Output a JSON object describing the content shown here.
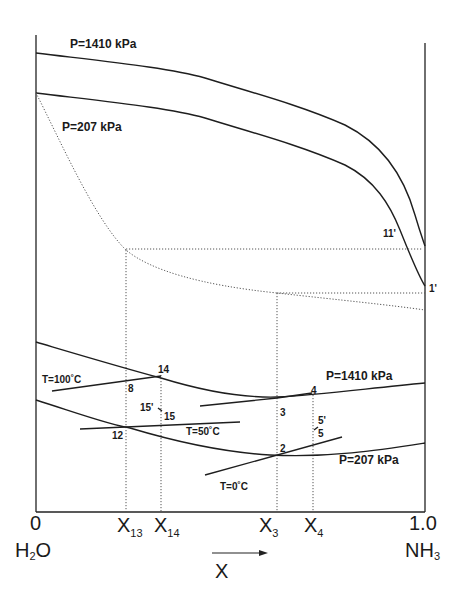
{
  "diagram": {
    "type": "enthalpy-concentration diagram (ammonia-water)",
    "axis": {
      "x_left_tick": "0",
      "x_right_tick": "1.0",
      "x_left_species": "H",
      "x_left_species_sub": "2",
      "x_left_species_tail": "O",
      "x_right_species": "NH",
      "x_right_species_sub": "3",
      "x_label": "X",
      "composition_ticks": [
        {
          "base": "X",
          "sub": "13"
        },
        {
          "base": "X",
          "sub": "14"
        },
        {
          "base": "X",
          "sub": "3"
        },
        {
          "base": "X",
          "sub": "4"
        }
      ]
    },
    "curve_labels": {
      "vapor_high_pressure": "P=1410 kPa",
      "vapor_low_pressure": "P=207 kPa",
      "liquid_high_pressure": "P=1410 kPa",
      "liquid_low_pressure": "P=207 kPa"
    },
    "isotherms": {
      "t100": "T=100˚C",
      "t50": "T=50˚C",
      "t0": "T=0˚C"
    },
    "state_points": {
      "p11prime": "11'",
      "p1prime": "1'",
      "p14": "14",
      "p8": "8",
      "p15prime": "15'",
      "p15": "15",
      "p12": "12",
      "p4": "4",
      "p3": "3",
      "p5prime": "5'",
      "p5": "5",
      "p2": "2"
    }
  }
}
